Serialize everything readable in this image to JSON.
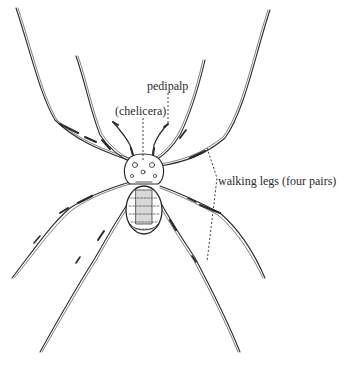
{
  "figure": {
    "labels": {
      "pedipalp": "pedipalp",
      "chelicera": "(chelicera)",
      "walking_legs": "walking legs (four pairs)"
    },
    "colors": {
      "ink": "#2a2a2a",
      "background": "#ffffff"
    }
  }
}
